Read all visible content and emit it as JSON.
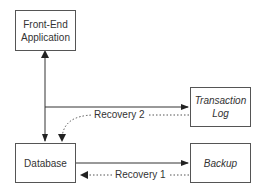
{
  "nodes": {
    "frontend": {
      "line1": "Front-End",
      "line2": "Application"
    },
    "database": {
      "label": "Database"
    },
    "txlog": {
      "line1": "Transaction",
      "line2": "Log"
    },
    "backup": {
      "label": "Backup"
    }
  },
  "edges": {
    "recovery2": "Recovery 2",
    "recovery1": "Recovery 1"
  }
}
